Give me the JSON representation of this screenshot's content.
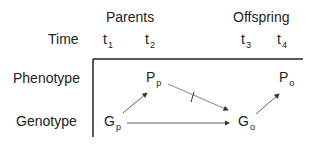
{
  "header": {
    "group_parents": "Parents",
    "group_offspring": "Offspring",
    "time_label": "Time",
    "times": [
      {
        "base": "t",
        "sub": "1"
      },
      {
        "base": "t",
        "sub": "2"
      },
      {
        "base": "t",
        "sub": "3"
      },
      {
        "base": "t",
        "sub": "4"
      }
    ]
  },
  "rows": {
    "phenotype": "Phenotype",
    "genotype": "Genotype"
  },
  "nodes": {
    "Pp": {
      "base": "P",
      "sub": "p"
    },
    "Po": {
      "base": "P",
      "sub": "o"
    },
    "Gp": {
      "base": "G",
      "sub": "p"
    },
    "Go": {
      "base": "G",
      "sub": "o"
    }
  },
  "edges": [
    {
      "from": "Gp",
      "to": "Pp",
      "blocked": false
    },
    {
      "from": "Pp",
      "to": "Go",
      "blocked": true
    },
    {
      "from": "Gp",
      "to": "Go",
      "blocked": false
    },
    {
      "from": "Go",
      "to": "Po",
      "blocked": false
    }
  ]
}
